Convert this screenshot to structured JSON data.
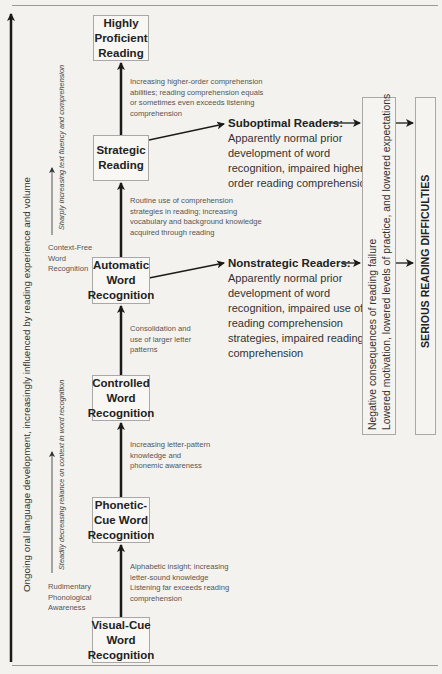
{
  "diagram": {
    "type": "flowchart",
    "stages": [
      {
        "id": "visual-cue",
        "label": "Visual-Cue\nWord\nRecognition"
      },
      {
        "id": "phonetic-cue",
        "label": "Phonetic-\nCue Word\nRecognition"
      },
      {
        "id": "controlled",
        "label": "Controlled\nWord\nRecognition"
      },
      {
        "id": "automatic",
        "label": "Automatic\nWord\nRecognition"
      },
      {
        "id": "strategic",
        "label": "Strategic\nReading"
      },
      {
        "id": "highly-proficient",
        "label": "Highly\nProficient\nReading"
      }
    ],
    "transitions": [
      {
        "from": "visual-cue",
        "to": "phonetic-cue",
        "lines": [
          "Alphabetic insight; increasing",
          "letter-sound knowledge",
          "Listening far exceeds reading",
          "comprehension"
        ]
      },
      {
        "from": "phonetic-cue",
        "to": "controlled",
        "lines": [
          "Increasing letter-pattern",
          "knowledge and",
          "phonemic awareness"
        ]
      },
      {
        "from": "controlled",
        "to": "automatic",
        "lines": [
          "Consolidation and",
          "use of larger letter",
          "patterns"
        ]
      },
      {
        "from": "automatic",
        "to": "strategic",
        "lines": [
          "Routine use of comprehension",
          "strategies in reading; increasing",
          "vocabulary and background knowledge",
          "acquired through reading"
        ]
      },
      {
        "from": "strategic",
        "to": "highly-proficient",
        "lines": [
          "Increasing higher-order comprehension",
          "abilities; reading comprehension equals",
          "or sometimes even exceeds listening",
          "comprehension"
        ]
      }
    ],
    "readers": [
      {
        "id": "suboptimal",
        "from": "strategic",
        "title": "Suboptimal Readers:",
        "lines": [
          "Apparently normal prior",
          "development of word",
          "recognition, impaired higher-",
          "order reading comprehension"
        ]
      },
      {
        "id": "nonstrategic",
        "from": "automatic",
        "title": "Nonstrategic Readers:",
        "lines": [
          "Apparently normal prior",
          "development of word",
          "recognition, impaired use of",
          "reading comprehension",
          "strategies, impaired reading",
          "comprehension"
        ]
      }
    ],
    "consequences": {
      "line1": "Negative consequences of reading failure",
      "line2": "Lowered motivation, lowered levels of practice, and lowered expectations"
    },
    "outcome": "SERIOUS READING DIFFICULTIES",
    "side_labels": {
      "main_axis": "Ongoing oral language development, increasingly  influenced by reading experience and volume",
      "upper_axis": "Sharply increasing text fluency and comprehension",
      "lower_axis": "Steadily decreasing reliance on context in word recognition",
      "context_free": [
        "Context-Free",
        "Word",
        "Recognition"
      ],
      "rudimentary": [
        "Rudimentary",
        "Phonological",
        "Awareness"
      ]
    }
  }
}
